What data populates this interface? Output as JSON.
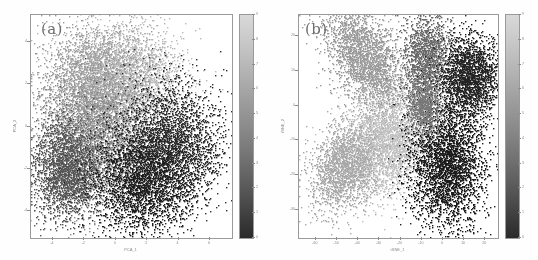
{
  "figure": {
    "background": "#ffffff",
    "panel_count": 2
  },
  "chart_data": [
    {
      "type": "scatter",
      "panel": "(a)",
      "title": "",
      "xlabel": "PCA_1",
      "ylabel": "PCA_2",
      "xlim": [
        -5.4,
        7.4
      ],
      "ylim": [
        -5.3,
        5.3
      ],
      "xticks": [
        -4,
        -2,
        0,
        2,
        4,
        6
      ],
      "yticks": [
        -4,
        -2,
        0,
        2,
        4
      ],
      "grid": false,
      "colormap": "gray_r",
      "colorbar": {
        "label": "",
        "vmin": 0,
        "vmax": 9,
        "ticks": [
          0,
          1,
          2,
          3,
          4,
          5,
          6,
          7,
          8,
          9
        ],
        "orientation": "vertical",
        "top_color": "#d9d9d9",
        "bottom_color": "#2a2a2a"
      },
      "n_points": 16000,
      "description": "Single diffuse overlapping blob of points; light-gray cluster upper-left, mid-gray center, dark cluster right and lower-left",
      "clusters": [
        {
          "label": 8,
          "cx": 0.2,
          "cy": 2.3,
          "sx": 1.9,
          "sy": 1.3,
          "n": 3400,
          "color": "#b9b9b9"
        },
        {
          "label": 6,
          "cx": -1.6,
          "cy": 1.5,
          "sx": 1.7,
          "sy": 1.6,
          "n": 2600,
          "color": "#9d9d9d"
        },
        {
          "label": 5,
          "cx": -1.0,
          "cy": -1.0,
          "sx": 1.8,
          "sy": 1.5,
          "n": 2600,
          "color": "#8a8a8a"
        },
        {
          "label": 3,
          "cx": -3.2,
          "cy": -2.1,
          "sx": 1.1,
          "sy": 1.2,
          "n": 2200,
          "color": "#565656"
        },
        {
          "label": 1,
          "cx": 3.5,
          "cy": -0.9,
          "sx": 1.7,
          "sy": 1.5,
          "n": 3000,
          "color": "#2e2e2e"
        },
        {
          "label": 0,
          "cx": 1.6,
          "cy": -2.8,
          "sx": 1.6,
          "sy": 1.2,
          "n": 2200,
          "color": "#1f1f1f"
        }
      ]
    },
    {
      "type": "scatter",
      "panel": "(b)",
      "title": "",
      "xlabel": "tSNE_1",
      "ylabel": "tSNE_2",
      "xlim": [
        -68,
        26
      ],
      "ylim": [
        -38,
        26
      ],
      "xticks": [
        -60,
        -50,
        -40,
        -30,
        -20,
        -10,
        0,
        10,
        20
      ],
      "yticks": [
        20,
        10,
        0,
        -10,
        -20,
        -30
      ],
      "grid": false,
      "colormap": "gray_r",
      "colorbar": {
        "label": "",
        "vmin": 0,
        "vmax": 9,
        "ticks": [
          0,
          1,
          2,
          3,
          4,
          5,
          6,
          7,
          8,
          9
        ],
        "orientation": "vertical",
        "top_color": "#d9d9d9",
        "bottom_color": "#2a2a2a"
      },
      "n_points": 16000,
      "description": "Petal/lobe structure radiating from a central hub; well separated clusters with distinct gray levels",
      "clusters": [
        {
          "label": 7,
          "cx": -36,
          "cy": 13,
          "sx": 11,
          "sy": 6,
          "rot": -32,
          "n": 2600,
          "color": "#9b9b9b"
        },
        {
          "label": 8,
          "cx": -28,
          "cy": -11,
          "sx": 11,
          "sy": 7,
          "rot": 10,
          "n": 3000,
          "color": "#c0c0c0"
        },
        {
          "label": 6,
          "cx": -47,
          "cy": -18,
          "sx": 8,
          "sy": 6,
          "rot": 25,
          "n": 1700,
          "color": "#a8a8a8"
        },
        {
          "label": 5,
          "cx": -7,
          "cy": 14,
          "sx": 6,
          "sy": 6,
          "rot": 0,
          "n": 1500,
          "color": "#6a6a6a"
        },
        {
          "label": 1,
          "cx": 13,
          "cy": 8,
          "sx": 7,
          "sy": 6,
          "rot": 0,
          "n": 2200,
          "color": "#252525"
        },
        {
          "label": 0,
          "cx": 2,
          "cy": -17,
          "sx": 9,
          "sy": 9,
          "rot": -15,
          "n": 3200,
          "color": "#1c1c1c"
        },
        {
          "label": 3,
          "cx": -9,
          "cy": 0,
          "sx": 4,
          "sy": 4,
          "rot": 0,
          "n": 900,
          "color": "#787878"
        }
      ]
    }
  ]
}
